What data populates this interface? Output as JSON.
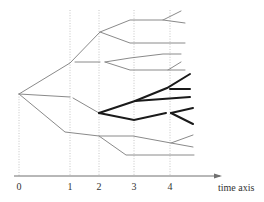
{
  "diagram": {
    "type": "branching-tree-over-time",
    "axis": {
      "label": "time axis",
      "ticks": [
        {
          "label": "0",
          "x": 19
        },
        {
          "label": "1",
          "x": 70
        },
        {
          "label": "2",
          "x": 99
        },
        {
          "label": "3",
          "x": 134
        },
        {
          "label": "4",
          "x": 170
        }
      ]
    },
    "colors": {
      "thin_branch": "#8a8a8a",
      "highlight_branch": "#1a1a1a",
      "guide": "#b8b8b8",
      "axis": "#707070"
    },
    "root": {
      "x": 19,
      "y": 94
    },
    "thin_paths": [
      "M19,94 L70,63 L100,32 L130,20 L163,20 L181,11",
      "M163,20 L185,23",
      "M100,32 L130,43 L185,43",
      "M75,62 L100,62",
      "M105,62 L130,58 L163,54 L181,54",
      "M105,62 L130,70 L168,70 L181,62",
      "M168,70 L185,70",
      "M19,94 L70,97",
      "M73,98 L99,113",
      "M19,94 L65,132 L99,136 L133,136 L171,143 L193,135",
      "M171,143 L193,147",
      "M99,136 L126,155 L194,155"
    ],
    "highlight_paths": [
      "M99,113 L135,101 L167,88 L190,74",
      "M170,89 L190,89",
      "M135,101 L190,97",
      "M99,113 L134,120 L166,113",
      "M171,113 L193,108",
      "M171,113 L193,124"
    ]
  }
}
